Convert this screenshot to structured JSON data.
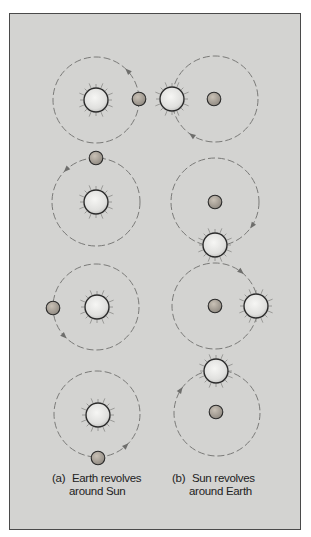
{
  "figure": {
    "background_color": "#d3d3d1",
    "orbit_color": "#7a7a78",
    "sun_fill": "#ececea",
    "earth_fill": "#aaa39a",
    "outline_color": "#2a2a2a",
    "columns": [
      {
        "id": "a",
        "label": "(a)",
        "caption_line1": "Earth revolves",
        "caption_line2": "around Sun",
        "center_body": "sun",
        "orbiting_body": "earth",
        "panels": [
          {
            "orbit_center": [
              96,
              100
            ],
            "orbit_r": 43,
            "earth": [
              139,
              99
            ],
            "sun": [
              96,
              100
            ],
            "arrow_angle": -45
          },
          {
            "orbit_center": [
              96,
              202
            ],
            "orbit_r": 44,
            "earth": [
              96,
              158
            ],
            "sun": [
              96,
              202
            ],
            "arrow_angle": -135
          },
          {
            "orbit_center": [
              96,
              307
            ],
            "orbit_r": 43,
            "earth": [
              53,
              308
            ],
            "sun": [
              97,
              307
            ],
            "arrow_angle": 135
          },
          {
            "orbit_center": [
              97,
              414
            ],
            "orbit_r": 43,
            "earth": [
              98,
              458
            ],
            "sun": [
              98,
              415
            ],
            "arrow_angle": 45
          }
        ]
      },
      {
        "id": "b",
        "label": "(b)",
        "caption_line1": "Sun revolves",
        "caption_line2": "around Earth",
        "center_body": "earth",
        "orbiting_body": "sun",
        "panels": [
          {
            "orbit_center": [
              215,
              99
            ],
            "orbit_r": 43,
            "earth": [
              214,
              99
            ],
            "sun": [
              172,
              99
            ],
            "arrow_angle": 125
          },
          {
            "orbit_center": [
              215,
              202
            ],
            "orbit_r": 44,
            "earth": [
              215,
              202
            ],
            "sun": [
              215,
              245
            ],
            "arrow_angle": 35
          },
          {
            "orbit_center": [
              215,
              306
            ],
            "orbit_r": 43,
            "earth": [
              215,
              306
            ],
            "sun": [
              256,
              306
            ],
            "arrow_angle": -50
          },
          {
            "orbit_center": [
              217,
              413
            ],
            "orbit_r": 43,
            "earth": [
              216,
              412
            ],
            "sun": [
              216,
              371
            ],
            "arrow_angle": -145
          }
        ]
      }
    ]
  }
}
